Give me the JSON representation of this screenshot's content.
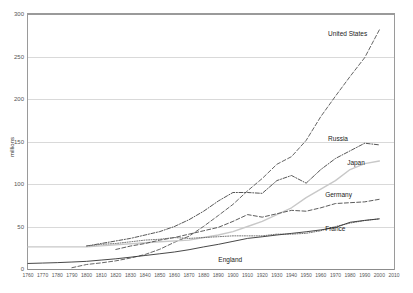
{
  "axes": {
    "ylabel": "millions",
    "yticks": [
      0,
      50,
      100,
      150,
      200,
      250,
      300
    ],
    "xticks": [
      1760,
      1770,
      1780,
      1790,
      1800,
      1810,
      1820,
      1830,
      1840,
      1850,
      1860,
      1870,
      1880,
      1890,
      1900,
      1910,
      1920,
      1930,
      1940,
      1950,
      1960,
      1970,
      1980,
      1990,
      2000,
      2010
    ]
  },
  "chart_data": {
    "type": "line",
    "title": "",
    "xlabel": "",
    "ylabel": "millions",
    "xlim": [
      1760,
      2010
    ],
    "ylim": [
      0,
      300
    ],
    "grid": true,
    "legend_position": "inline-right-of-series",
    "x": [
      1760,
      1770,
      1780,
      1790,
      1800,
      1810,
      1820,
      1830,
      1840,
      1850,
      1860,
      1870,
      1880,
      1890,
      1900,
      1910,
      1920,
      1930,
      1940,
      1950,
      1960,
      1970,
      1980,
      1990,
      2000
    ],
    "series": [
      {
        "name": "United States",
        "style": "dashed",
        "color": "#555555",
        "label_x": 1965,
        "label_y": 275,
        "values": [
          null,
          null,
          null,
          1.5,
          5.3,
          7.2,
          9.6,
          12.9,
          17.1,
          23.2,
          31.4,
          38.6,
          50.2,
          62.9,
          76.0,
          92.0,
          106.5,
          123.2,
          132.2,
          151.3,
          179.3,
          203.3,
          226.5,
          248.7,
          281.4
        ]
      },
      {
        "name": "Russia",
        "style": "dash-dot",
        "color": "#444444",
        "label_x": 1965,
        "label_y": 152,
        "values": [
          null,
          null,
          null,
          null,
          null,
          null,
          null,
          null,
          null,
          null,
          null,
          null,
          null,
          null,
          null,
          null,
          null,
          null,
          null,
          null,
          null,
          null,
          null,
          null,
          null
        ]
      },
      {
        "name": "Japan",
        "style": "solid-light",
        "color": "#c8c8c8",
        "label_x": 1978,
        "label_y": 124,
        "values": [
          null,
          null,
          null,
          null,
          null,
          null,
          null,
          null,
          null,
          null,
          null,
          null,
          null,
          null,
          null,
          null,
          null,
          null,
          null,
          null,
          null,
          null,
          null,
          null,
          null
        ]
      },
      {
        "name": "Germany",
        "style": "dashed",
        "color": "#4a4a4a",
        "label_x": 1963,
        "label_y": 86,
        "values": [
          null,
          null,
          null,
          null,
          null,
          null,
          null,
          null,
          null,
          null,
          null,
          null,
          null,
          null,
          null,
          null,
          null,
          null,
          null,
          null,
          null,
          null,
          null,
          null,
          null
        ]
      },
      {
        "name": "France",
        "style": "dotted",
        "color": "#666666",
        "label_x": 1963,
        "label_y": 46,
        "values": [
          null,
          null,
          null,
          null,
          null,
          null,
          null,
          null,
          null,
          null,
          null,
          null,
          null,
          null,
          null,
          null,
          null,
          null,
          null,
          null,
          null,
          null,
          null,
          null,
          null
        ]
      },
      {
        "name": "England",
        "style": "solid",
        "color": "#333333",
        "label_x": 1890,
        "label_y": 9,
        "values": [
          null,
          null,
          null,
          null,
          null,
          null,
          null,
          null,
          null,
          null,
          null,
          null,
          null,
          null,
          null,
          null,
          null,
          null,
          null,
          null,
          null,
          null,
          null,
          null,
          null
        ]
      }
    ],
    "series_points": {
      "United States": [
        [
          1790,
          1.5
        ],
        [
          1800,
          5.3
        ],
        [
          1810,
          7.2
        ],
        [
          1820,
          9.6
        ],
        [
          1830,
          12.9
        ],
        [
          1840,
          17.1
        ],
        [
          1850,
          23.2
        ],
        [
          1860,
          31.4
        ],
        [
          1870,
          38.6
        ],
        [
          1880,
          50.2
        ],
        [
          1890,
          62.9
        ],
        [
          1900,
          76.0
        ],
        [
          1910,
          92.0
        ],
        [
          1920,
          106.5
        ],
        [
          1930,
          123.2
        ],
        [
          1940,
          132.2
        ],
        [
          1950,
          151.3
        ],
        [
          1960,
          179.3
        ],
        [
          1970,
          203.3
        ],
        [
          1980,
          226.5
        ],
        [
          1990,
          248.7
        ],
        [
          2000,
          281.4
        ]
      ],
      "Russia": [
        [
          1800,
          27.0
        ],
        [
          1810,
          30.0
        ],
        [
          1820,
          33.0
        ],
        [
          1830,
          36.0
        ],
        [
          1840,
          40.0
        ],
        [
          1850,
          44.0
        ],
        [
          1860,
          50.0
        ],
        [
          1870,
          58.0
        ],
        [
          1880,
          68.0
        ],
        [
          1890,
          80.0
        ],
        [
          1900,
          90.0
        ],
        [
          1910,
          90.0
        ],
        [
          1920,
          89.0
        ],
        [
          1930,
          104.0
        ],
        [
          1940,
          110.0
        ],
        [
          1950,
          101.0
        ],
        [
          1960,
          117.0
        ],
        [
          1970,
          130.0
        ],
        [
          1980,
          139.0
        ],
        [
          1990,
          148.0
        ],
        [
          2000,
          146.0
        ]
      ],
      "Japan": [
        [
          1760,
          26.0
        ],
        [
          1800,
          26.0
        ],
        [
          1850,
          32.0
        ],
        [
          1870,
          34.0
        ],
        [
          1880,
          37.0
        ],
        [
          1890,
          40.0
        ],
        [
          1900,
          44.0
        ],
        [
          1910,
          50.0
        ],
        [
          1920,
          56.0
        ],
        [
          1930,
          64.0
        ],
        [
          1940,
          72.0
        ],
        [
          1950,
          84.0
        ],
        [
          1960,
          94.0
        ],
        [
          1970,
          104.0
        ],
        [
          1980,
          117.0
        ],
        [
          1990,
          124.0
        ],
        [
          2000,
          127.0
        ]
      ],
      "Germany": [
        [
          1820,
          23.0
        ],
        [
          1830,
          27.0
        ],
        [
          1840,
          30.0
        ],
        [
          1850,
          34.0
        ],
        [
          1860,
          37.0
        ],
        [
          1870,
          41.0
        ],
        [
          1880,
          45.0
        ],
        [
          1890,
          49.0
        ],
        [
          1900,
          56.0
        ],
        [
          1910,
          64.0
        ],
        [
          1920,
          61.0
        ],
        [
          1930,
          65.0
        ],
        [
          1940,
          69.0
        ],
        [
          1950,
          68.0
        ],
        [
          1960,
          72.0
        ],
        [
          1970,
          77.0
        ],
        [
          1980,
          78.0
        ],
        [
          1990,
          79.0
        ],
        [
          2000,
          82.0
        ]
      ],
      "France": [
        [
          1800,
          27.0
        ],
        [
          1810,
          29.0
        ],
        [
          1820,
          30.0
        ],
        [
          1830,
          32.0
        ],
        [
          1840,
          34.0
        ],
        [
          1850,
          35.0
        ],
        [
          1860,
          37.0
        ],
        [
          1870,
          36.0
        ],
        [
          1880,
          37.0
        ],
        [
          1890,
          38.0
        ],
        [
          1900,
          39.0
        ],
        [
          1910,
          39.0
        ],
        [
          1920,
          39.0
        ],
        [
          1930,
          41.0
        ],
        [
          1940,
          41.0
        ],
        [
          1950,
          42.0
        ],
        [
          1960,
          45.0
        ],
        [
          1970,
          50.0
        ],
        [
          1980,
          54.0
        ],
        [
          1990,
          57.0
        ],
        [
          2000,
          59.0
        ]
      ],
      "England": [
        [
          1760,
          6.5
        ],
        [
          1770,
          7.0
        ],
        [
          1780,
          7.5
        ],
        [
          1790,
          8.2
        ],
        [
          1800,
          9.0
        ],
        [
          1810,
          10.5
        ],
        [
          1820,
          12.0
        ],
        [
          1830,
          13.9
        ],
        [
          1840,
          15.9
        ],
        [
          1850,
          17.9
        ],
        [
          1860,
          20.0
        ],
        [
          1870,
          22.7
        ],
        [
          1880,
          26.0
        ],
        [
          1890,
          29.0
        ],
        [
          1900,
          32.5
        ],
        [
          1910,
          36.0
        ],
        [
          1920,
          37.9
        ],
        [
          1930,
          40.0
        ],
        [
          1940,
          41.9
        ],
        [
          1950,
          43.8
        ],
        [
          1960,
          46.0
        ],
        [
          1970,
          48.8
        ],
        [
          1980,
          55.0
        ],
        [
          1990,
          57.2
        ],
        [
          2000,
          59.0
        ]
      ]
    }
  }
}
